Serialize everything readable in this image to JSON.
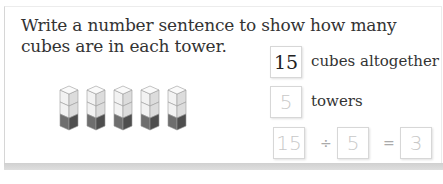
{
  "question": {
    "prompt": "Write a number sentence to show how many cubes are in each tower."
  },
  "illustration": {
    "tower_count": 5,
    "cubes_per_tower": 3,
    "colors": {
      "light": "#f2f2f2",
      "mid": "#dcdcdc",
      "dark": "#6e6e6e",
      "edge": "#9a9a9a"
    }
  },
  "facts": [
    {
      "value": "15",
      "label": "cubes altogether"
    },
    {
      "value": "5",
      "label": "towers"
    }
  ],
  "equation": {
    "dividend": "15",
    "operator": "÷",
    "divisor": "5",
    "equals": "=",
    "quotient": "3"
  }
}
